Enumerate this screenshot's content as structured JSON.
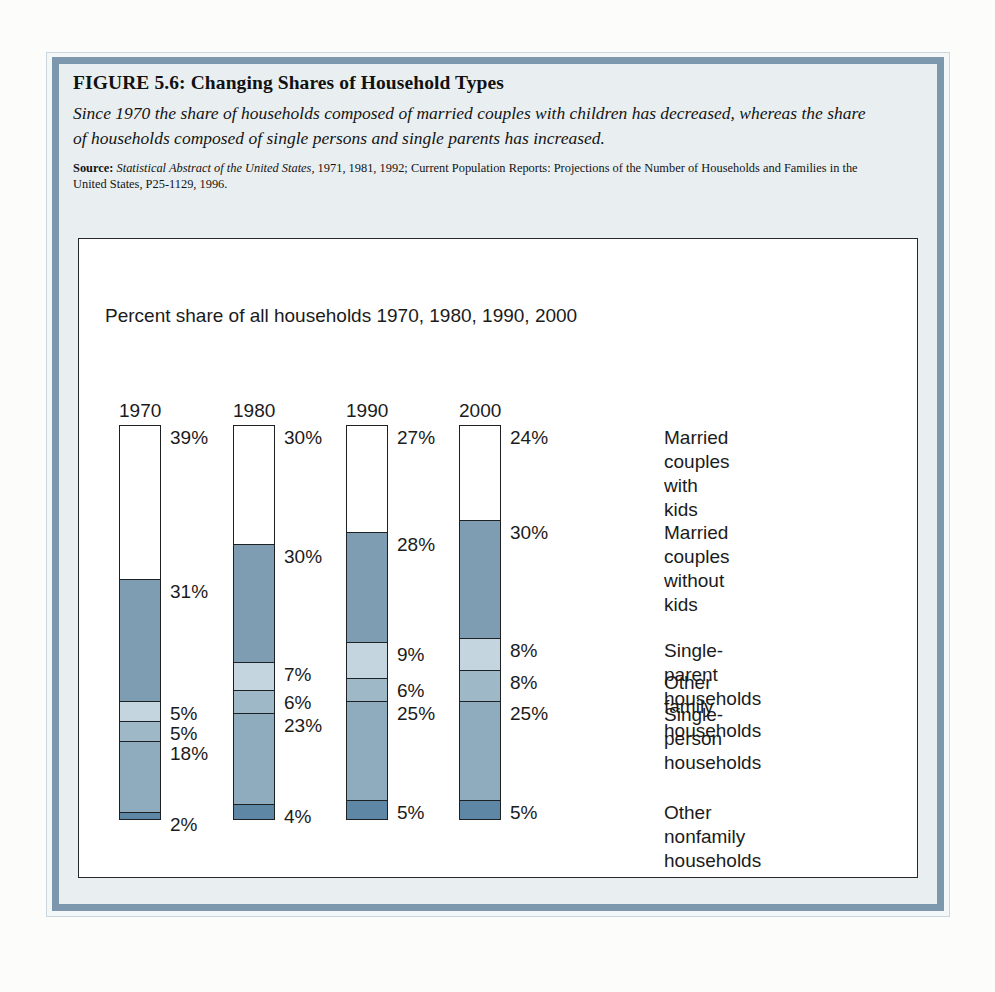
{
  "figure": {
    "title": "FIGURE 5.6:  Changing Shares of Household Types",
    "subtitle": "Since 1970 the share of households composed of married couples with children has decreased, whereas the share of households composed of single persons and single parents has increased.",
    "source_label": "Source:",
    "source_italic": "Statistical Abstract of the United States,",
    "source_rest": " 1971, 1981, 1992; Current Population Reports: Projections of the Number of Households and Families in the United States, P25-1129, 1996."
  },
  "chart_caption": "Percent share of all households 1970, 1980, 1990, 2000",
  "colors": {
    "frame_band": "#7d98ac",
    "frame_inner_bg": "#e9eff1",
    "chart_bg": "#ffffff",
    "segment_outline": "#1d2124",
    "married_with_kids": "#ffffff",
    "married_without_kids": "#7e9cb2",
    "single_parent": "#c4d5e0",
    "other_family": "#9fb8c8",
    "single_person": "#8fabbe",
    "other_nonfamily": "#5e87a6"
  },
  "chart_data": {
    "type": "bar",
    "subtype": "100% stacked column",
    "title": "Percent share of all households 1970, 1980, 1990, 2000",
    "xlabel": "",
    "ylabel": "",
    "ylim": [
      0,
      100
    ],
    "grid": false,
    "legend_position": "right",
    "categories": [
      "1970",
      "1980",
      "1990",
      "2000"
    ],
    "stack_order_top_to_bottom": [
      "Married couples with kids",
      "Married couples without kids",
      "Single-parent households",
      "Other family households",
      "Single-person households",
      "Other nonfamily households"
    ],
    "series": [
      {
        "name": "Married couples with kids",
        "color": "#ffffff",
        "values": [
          39,
          30,
          27,
          24
        ],
        "labels": [
          "39%",
          "30%",
          "27%",
          "24%"
        ]
      },
      {
        "name": "Married couples without kids",
        "color": "#7e9cb2",
        "values": [
          31,
          30,
          28,
          30
        ],
        "labels": [
          "31%",
          "30%",
          "28%",
          "30%"
        ]
      },
      {
        "name": "Single-parent households",
        "color": "#c4d5e0",
        "values": [
          5,
          7,
          9,
          8
        ],
        "labels": [
          "5%",
          "7%",
          "9%",
          "8%"
        ]
      },
      {
        "name": "Other family households",
        "color": "#9fb8c8",
        "values": [
          5,
          6,
          6,
          8
        ],
        "labels": [
          "5%",
          "6%",
          "6%",
          "8%"
        ]
      },
      {
        "name": "Single-person households",
        "color": "#8fabbe",
        "values": [
          18,
          23,
          25,
          25
        ],
        "labels": [
          "18%",
          "23%",
          "25%",
          "25%"
        ]
      },
      {
        "name": "Other nonfamily households",
        "color": "#5e87a6",
        "values": [
          2,
          4,
          5,
          5
        ],
        "labels": [
          "2%",
          "4%",
          "5%",
          "5%"
        ]
      }
    ]
  },
  "legend": {
    "items": [
      {
        "percent": "24%",
        "label": "Married couples\nwith kids"
      },
      {
        "percent": "30%",
        "label": "Married couples\nwithout kids"
      },
      {
        "percent": "8%",
        "label": "Single-parent households"
      },
      {
        "percent": "8%",
        "label": "Other family households"
      },
      {
        "percent": "25%",
        "label": "Single-person\nhouseholds"
      },
      {
        "percent": "5%",
        "label": "Other nonfamily\nhouseholds"
      }
    ]
  }
}
